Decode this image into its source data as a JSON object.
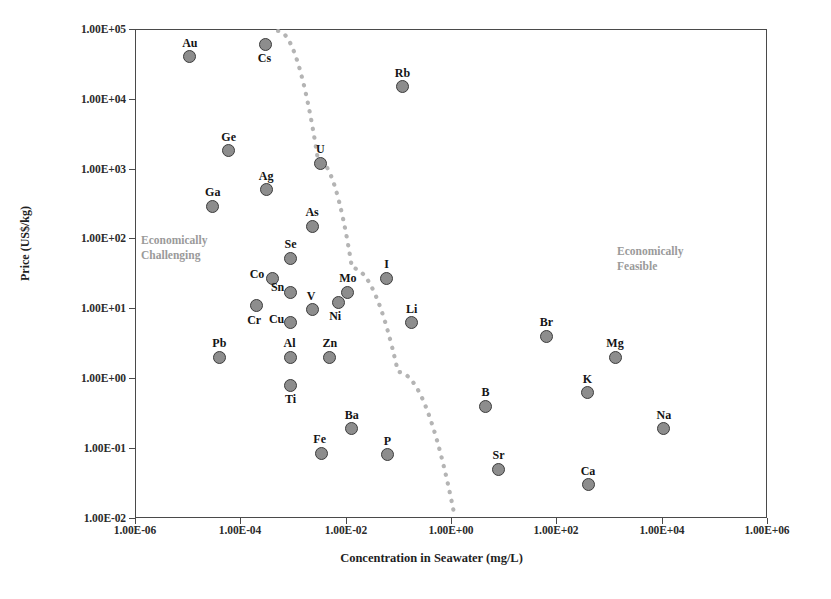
{
  "chart_data": {
    "type": "scatter",
    "title": "",
    "xlabel": "Concentration in Seawater (mg/L)",
    "ylabel": "Price (US$/kg)",
    "xscale": "log",
    "yscale": "log",
    "xlim": [
      1e-06,
      1000000.0
    ],
    "ylim": [
      0.01,
      100000.0
    ],
    "grid": false,
    "legend": null,
    "xticks": [
      "1.00E-06",
      "1.00E-04",
      "1.00E-02",
      "1.00E+00",
      "1.00E+02",
      "1.00E+04",
      "1.00E+06"
    ],
    "xtick_values": [
      1e-06,
      0.0001,
      0.01,
      1.0,
      100.0,
      10000.0,
      1000000.0
    ],
    "yticks": [
      "1.00E+05",
      "1.00E+04",
      "1.00E+03",
      "1.00E+02",
      "1.00E+01",
      "1.00E+00",
      "1.00E-01",
      "1.00E-02"
    ],
    "ytick_values": [
      100000.0,
      10000.0,
      1000.0,
      100.0,
      10.0,
      1.0,
      0.1,
      0.01
    ],
    "marker_style": {
      "shape": "circle",
      "fill": "#8d8d8d",
      "edge": "#3c3c3c",
      "size_px": 13
    },
    "points": [
      {
        "label": "Au",
        "x": 1.1e-05,
        "y": 40000,
        "lx": 0,
        "ly": -14
      },
      {
        "label": "Cs",
        "x": 0.0003,
        "y": 60000,
        "lx": -1,
        "ly": 14
      },
      {
        "label": "Rb",
        "x": 0.12,
        "y": 15000,
        "lx": 0,
        "ly": -14
      },
      {
        "label": "Ge",
        "x": 6e-05,
        "y": 1800,
        "lx": 0,
        "ly": -14
      },
      {
        "label": "Ag",
        "x": 0.00031,
        "y": 500,
        "lx": 0,
        "ly": -14
      },
      {
        "label": "Ga",
        "x": 3e-05,
        "y": 290,
        "lx": 0,
        "ly": -14
      },
      {
        "label": "U",
        "x": 0.0033,
        "y": 1200,
        "lx": 0,
        "ly": -14
      },
      {
        "label": "As",
        "x": 0.0023,
        "y": 150,
        "lx": 0,
        "ly": -14
      },
      {
        "label": "Se",
        "x": 0.0009,
        "y": 52,
        "lx": 0,
        "ly": -14
      },
      {
        "label": "Co",
        "x": 0.0004,
        "y": 27,
        "lx": -15,
        "ly": -4
      },
      {
        "label": "Sn",
        "x": 0.0009,
        "y": 17,
        "lx": -13,
        "ly": -5
      },
      {
        "label": "Cr",
        "x": 0.0002,
        "y": 11,
        "lx": -2,
        "ly": 14
      },
      {
        "label": "Cu",
        "x": 0.0009,
        "y": 6.2,
        "lx": -14,
        "ly": -4
      },
      {
        "label": "V",
        "x": 0.0023,
        "y": 9.5,
        "lx": -1,
        "ly": -14
      },
      {
        "label": "Mo",
        "x": 0.011,
        "y": 17,
        "lx": 0,
        "ly": -14
      },
      {
        "label": "Ni",
        "x": 0.0072,
        "y": 12,
        "lx": -3,
        "ly": 13
      },
      {
        "label": "I",
        "x": 0.06,
        "y": 27,
        "lx": 0,
        "ly": -14
      },
      {
        "label": "Li",
        "x": 0.18,
        "y": 6.2,
        "lx": 0,
        "ly": -14
      },
      {
        "label": "Pb",
        "x": 4e-05,
        "y": 2.0,
        "lx": 0,
        "ly": -14
      },
      {
        "label": "Al",
        "x": 0.0009,
        "y": 2.0,
        "lx": -1,
        "ly": -14
      },
      {
        "label": "Zn",
        "x": 0.005,
        "y": 2.0,
        "lx": 0,
        "ly": -14
      },
      {
        "label": "Ti",
        "x": 0.0009,
        "y": 0.8,
        "lx": 0,
        "ly": 14
      },
      {
        "label": "Ba",
        "x": 0.013,
        "y": 0.19,
        "lx": 0,
        "ly": -14
      },
      {
        "label": "Fe",
        "x": 0.0035,
        "y": 0.085,
        "lx": -2,
        "ly": -14
      },
      {
        "label": "P",
        "x": 0.062,
        "y": 0.08,
        "lx": 0,
        "ly": -14
      },
      {
        "label": "B",
        "x": 4.5,
        "y": 0.4,
        "lx": 0,
        "ly": -14
      },
      {
        "label": "Sr",
        "x": 8.0,
        "y": 0.05,
        "lx": 0,
        "ly": -14
      },
      {
        "label": "Br",
        "x": 65,
        "y": 4.0,
        "lx": 0,
        "ly": -14
      },
      {
        "label": "K",
        "x": 390,
        "y": 0.62,
        "lx": 0,
        "ly": -14
      },
      {
        "label": "Ca",
        "x": 400,
        "y": 0.03,
        "lx": 0,
        "ly": -14
      },
      {
        "label": "Mg",
        "x": 1300,
        "y": 2.0,
        "lx": 0,
        "ly": -14
      },
      {
        "label": "Na",
        "x": 11000,
        "y": 0.19,
        "lx": 0,
        "ly": -14
      }
    ],
    "annotations": [
      {
        "name": "economically-challenging",
        "text": "Economically\nChallenging",
        "color": "#9a9a9a"
      },
      {
        "name": "economically-feasible",
        "text": "Economically\nFeasible",
        "color": "#9a9a9a"
      }
    ],
    "divider": {
      "name": "feasibility-boundary",
      "style": "dotted",
      "color": "#b4b4b4",
      "points_px": [
        [
          278,
          31
        ],
        [
          318,
          160
        ],
        [
          352,
          268
        ],
        [
          398,
          372
        ],
        [
          455,
          518
        ]
      ]
    }
  }
}
